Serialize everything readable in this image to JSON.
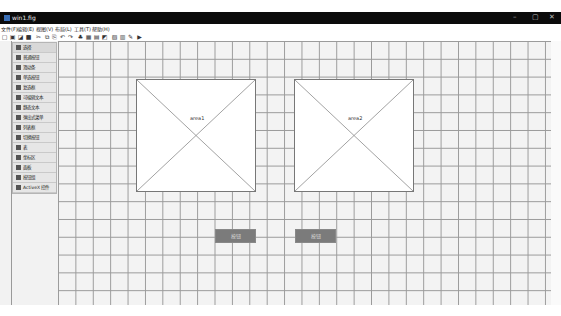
{
  "window": {
    "title": "win1.fig",
    "controls": [
      "minimize",
      "maximize",
      "close"
    ]
  },
  "menubar": {
    "items": [
      {
        "label": "文件(F)"
      },
      {
        "label": "编辑(E)"
      },
      {
        "label": "视图(V)"
      },
      {
        "label": "布局(L)"
      },
      {
        "label": "工具(T)"
      },
      {
        "label": "帮助(H)"
      }
    ]
  },
  "toolbar": {
    "icons": [
      "new-icon",
      "open-icon",
      "save-as-icon",
      "save-icon",
      "cut-icon",
      "copy-icon",
      "paste-icon",
      "undo-icon",
      "redo-icon",
      "align-icon",
      "distribute-icon",
      "editor-icon",
      "property-icon",
      "object-browser-icon",
      "menu-editor-icon",
      "m-file-icon",
      "run-icon"
    ],
    "glyphs": [
      "▢",
      "▣",
      "◪",
      "■",
      "✂",
      "⧉",
      "⎘",
      "↶",
      "↷",
      "♣",
      "▦",
      "▤",
      "◩",
      "▧",
      "▥",
      "✎",
      "▶"
    ]
  },
  "palette": {
    "items": [
      {
        "label": "选择",
        "icon": "pointer-icon"
      },
      {
        "label": "普通按钮",
        "icon": "push-button-icon"
      },
      {
        "label": "滑动条",
        "icon": "slider-icon"
      },
      {
        "label": "单选按钮",
        "icon": "radio-button-icon"
      },
      {
        "label": "复选框",
        "icon": "checkbox-icon"
      },
      {
        "label": "可编辑文本",
        "icon": "edit-text-icon"
      },
      {
        "label": "静态文本",
        "icon": "static-text-icon"
      },
      {
        "label": "弹出式菜单",
        "icon": "popup-menu-icon"
      },
      {
        "label": "列表框",
        "icon": "listbox-icon"
      },
      {
        "label": "切换按钮",
        "icon": "toggle-button-icon"
      },
      {
        "label": "表",
        "icon": "table-icon"
      },
      {
        "label": "坐标区",
        "icon": "axes-icon"
      },
      {
        "label": "面板",
        "icon": "panel-icon"
      },
      {
        "label": "按钮组",
        "icon": "button-group-icon"
      },
      {
        "label": "ActiveX 控件",
        "icon": "activex-icon"
      }
    ]
  },
  "canvas": {
    "areas": [
      {
        "label": "area1"
      },
      {
        "label": "area2"
      }
    ],
    "buttons": [
      {
        "label": "按钮"
      },
      {
        "label": "按钮"
      }
    ]
  },
  "colors": {
    "titlebar": "#0b0b0b",
    "grid_line": "#9a9a9a",
    "grid_bg": "#f3f3f3",
    "button_bg": "#7b7b7b"
  }
}
